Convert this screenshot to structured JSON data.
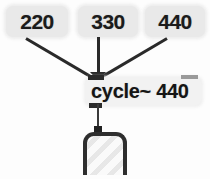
{
  "patch": {
    "background_color": "#fdfdfd",
    "cord_color": "#2a2a2a",
    "message_box_color": "#e9e9e9",
    "object_box_color": "#f2f2f2",
    "object_border_color": "#2e2e2e"
  },
  "message_boxes": [
    {
      "id": "box-220",
      "value": "220"
    },
    {
      "id": "box-330",
      "value": "330"
    },
    {
      "id": "box-440",
      "value": "440"
    }
  ],
  "object_box": {
    "text": "cycle~ 440",
    "name": "cycle~",
    "argument": "440",
    "inlets": [
      "signal-frequency-inlet",
      "phase-inlet"
    ],
    "outlets": [
      "signal-outlet"
    ]
  },
  "dac_object": {
    "label": "",
    "icon": "speaker-outline",
    "inlets": [
      "signal-inlet"
    ]
  },
  "connections": [
    {
      "from": "box-220",
      "to": "object_box.inlet0"
    },
    {
      "from": "box-330",
      "to": "object_box.inlet0"
    },
    {
      "from": "box-440",
      "to": "object_box.inlet0"
    },
    {
      "from": "object_box.outlet0",
      "to": "dac_object.inlet0"
    }
  ]
}
